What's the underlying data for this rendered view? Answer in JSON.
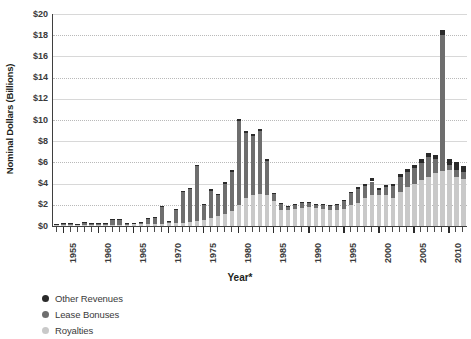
{
  "chart_data": {
    "type": "bar",
    "stacked": true,
    "title": "",
    "xlabel": "Year*",
    "ylabel": "Nominal Dollars (Billions)",
    "ylim": [
      0,
      20
    ],
    "ytick_step": 2,
    "ytick_labels": [
      "$0",
      "$2",
      "$4",
      "$6",
      "$8",
      "$10",
      "$12",
      "$14",
      "$16",
      "$18",
      "$20"
    ],
    "grid": true,
    "legend_position": "below-left",
    "series_order": [
      "Royalties",
      "Lease Bonuses",
      "Other Revenues"
    ],
    "series": [
      {
        "name": "Royalties",
        "color": "#c9c9c9",
        "values": [
          0.05,
          0.06,
          0.07,
          0.07,
          0.08,
          0.09,
          0.1,
          0.11,
          0.12,
          0.13,
          0.14,
          0.15,
          0.16,
          0.18,
          0.2,
          0.22,
          0.24,
          0.26,
          0.3,
          0.35,
          0.45,
          0.6,
          0.75,
          0.9,
          1.1,
          1.4,
          2.0,
          2.6,
          2.9,
          3.0,
          2.9,
          2.4,
          1.5,
          1.5,
          1.6,
          1.7,
          1.8,
          1.7,
          1.6,
          1.5,
          1.5,
          1.6,
          2.0,
          2.2,
          2.6,
          2.9,
          2.9,
          2.9,
          2.6,
          3.2,
          3.7,
          4.0,
          4.3,
          4.6,
          5.0,
          5.2,
          5.3,
          4.6,
          4.4
        ]
      },
      {
        "name": "Lease Bonuses",
        "color": "#6e6e6e",
        "values": [
          0.1,
          0.12,
          0.1,
          0.08,
          0.2,
          0.1,
          0.1,
          0.1,
          0.5,
          0.5,
          0.1,
          0.1,
          0.1,
          0.5,
          0.6,
          1.6,
          0.2,
          1.3,
          2.9,
          3.2,
          5.2,
          1.4,
          2.6,
          2.0,
          2.9,
          3.7,
          7.9,
          6.2,
          5.6,
          6.0,
          3.2,
          0.6,
          0.6,
          0.3,
          0.4,
          0.5,
          0.4,
          0.3,
          0.4,
          0.4,
          0.5,
          0.8,
          1.1,
          1.3,
          1.2,
          1.3,
          0.5,
          0.8,
          1.2,
          1.4,
          1.4,
          1.5,
          1.6,
          1.9,
          1.3,
          12.8,
          0.5,
          0.7,
          0.7
        ]
      },
      {
        "name": "Other Revenues",
        "color": "#2a2a2a",
        "values": [
          0.02,
          0.02,
          0.02,
          0.02,
          0.02,
          0.02,
          0.02,
          0.02,
          0.03,
          0.03,
          0.03,
          0.03,
          0.03,
          0.04,
          0.04,
          0.05,
          0.05,
          0.05,
          0.06,
          0.08,
          0.1,
          0.1,
          0.1,
          0.1,
          0.12,
          0.15,
          0.2,
          0.2,
          0.2,
          0.2,
          0.2,
          0.15,
          0.1,
          0.1,
          0.1,
          0.1,
          0.1,
          0.1,
          0.1,
          0.1,
          0.1,
          0.1,
          0.15,
          0.15,
          0.2,
          0.3,
          0.2,
          0.2,
          0.2,
          0.3,
          0.3,
          0.3,
          0.4,
          0.4,
          0.4,
          0.5,
          0.5,
          0.7,
          0.6
        ]
      }
    ],
    "categories": [
      1954,
      1955,
      1956,
      1957,
      1958,
      1959,
      1960,
      1961,
      1962,
      1963,
      1964,
      1965,
      1966,
      1967,
      1968,
      1969,
      1970,
      1971,
      1972,
      1973,
      1974,
      1975,
      1976,
      1977,
      1978,
      1979,
      1980,
      1981,
      1982,
      1983,
      1984,
      1985,
      1986,
      1987,
      1988,
      1989,
      1990,
      1991,
      1992,
      1993,
      1994,
      1995,
      1996,
      1997,
      1998,
      1999,
      2000,
      2001,
      2002,
      2003,
      2004,
      2005,
      2006,
      2007,
      2008,
      2009,
      2010,
      2011,
      2012
    ],
    "xtick_labels": [
      "1955",
      "1960",
      "1965",
      "1970",
      "1975",
      "1980",
      "1985",
      "1990",
      "1995",
      "2000",
      "2005",
      "2010"
    ],
    "xtick_years": [
      1955,
      1960,
      1965,
      1970,
      1975,
      1980,
      1985,
      1990,
      1995,
      2000,
      2005,
      2010
    ]
  },
  "legend": {
    "items": [
      {
        "label": "Other Revenues",
        "color": "#2a2a2a"
      },
      {
        "label": "Lease Bonuses",
        "color": "#6e6e6e"
      },
      {
        "label": "Royalties",
        "color": "#c9c9c9"
      }
    ]
  },
  "axes": {
    "y_title": "Nominal Dollars (Billions)",
    "x_title": "Year*"
  }
}
